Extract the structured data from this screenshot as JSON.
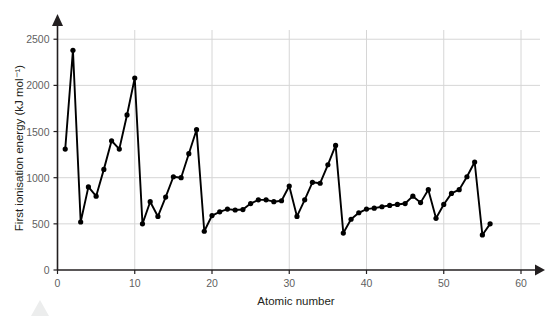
{
  "chart_data": {
    "type": "line",
    "title": "",
    "xlabel": "Atomic number",
    "ylabel": "First ionisation energy (kJ mol⁻¹)",
    "xlim": [
      0,
      60
    ],
    "ylim": [
      0,
      2600
    ],
    "xticks": [
      0,
      10,
      20,
      30,
      40,
      50,
      60
    ],
    "yticks": [
      0,
      500,
      1000,
      1500,
      2000,
      2500
    ],
    "grid": true,
    "grid_axis": "both",
    "legend": "none",
    "marker": "filled-circle",
    "series": [
      {
        "name": "First ionisation energy",
        "x": [
          1,
          2,
          3,
          4,
          5,
          6,
          7,
          8,
          9,
          10,
          11,
          12,
          13,
          14,
          15,
          16,
          17,
          18,
          19,
          20,
          21,
          22,
          23,
          24,
          25,
          26,
          27,
          28,
          29,
          30,
          31,
          32,
          33,
          34,
          35,
          36,
          37,
          38,
          39,
          40,
          41,
          42,
          43,
          44,
          45,
          46,
          47,
          48,
          49,
          50,
          51,
          52,
          53,
          54,
          55,
          56
        ],
        "values": [
          1310,
          2380,
          520,
          900,
          800,
          1090,
          1400,
          1310,
          1680,
          2080,
          500,
          740,
          580,
          790,
          1010,
          1000,
          1260,
          1520,
          420,
          590,
          630,
          660,
          650,
          655,
          720,
          760,
          760,
          740,
          750,
          910,
          580,
          760,
          950,
          940,
          1140,
          1350,
          400,
          550,
          620,
          660,
          670,
          685,
          700,
          710,
          720,
          800,
          730,
          870,
          560,
          710,
          830,
          870,
          1010,
          1170,
          380,
          500
        ],
        "labels": [
          "H",
          "He",
          "Li",
          "Be",
          "B",
          "C",
          "N",
          "O",
          "F",
          "Ne",
          "Na",
          "Mg",
          "Al",
          "Si",
          "P",
          "S",
          "Cl",
          "Ar",
          "K",
          "Ca",
          "Sc",
          "Ti",
          "V",
          "Cr",
          "Mn",
          "Fe",
          "Co",
          "Ni",
          "Cu",
          "Zn",
          "Ga",
          "Ge",
          "As",
          "Se",
          "Br",
          "Kr",
          "Rb",
          "Sr",
          "Y",
          "Zr",
          "Nb",
          "Mo",
          "Tc",
          "Ru",
          "Rh",
          "Pd",
          "Ag",
          "Cd",
          "In",
          "Sn",
          "Sb",
          "Te",
          "I",
          "Xe",
          "Cs",
          "Ba"
        ]
      }
    ]
  },
  "axes": {
    "x_tick_labels": [
      "0",
      "10",
      "20",
      "30",
      "40",
      "50",
      "60"
    ],
    "y_tick_labels": [
      "0",
      "500",
      "1000",
      "1500",
      "2000",
      "2500"
    ],
    "x_axis_title": "Atomic number",
    "y_axis_title": "First ionisation energy (kJ mol⁻¹)"
  },
  "colors": {
    "line": "#000000",
    "marker": "#000000",
    "grid": "#d6d6d6",
    "axis": "#231f20",
    "tick_text": "#5f5f5f",
    "background": "#ffffff",
    "watermark": "#eceded"
  }
}
